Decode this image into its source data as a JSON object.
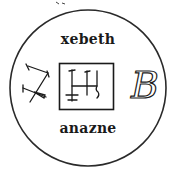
{
  "diagram": {
    "type": "seal",
    "top_text": "xebeth",
    "bottom_text": "anazne",
    "right_glyph": "B",
    "left_glyph": "sigil-z",
    "center_glyph": "sigil-box",
    "colors": {
      "ink": "#1a1a1a",
      "background": "#ffffff"
    }
  }
}
